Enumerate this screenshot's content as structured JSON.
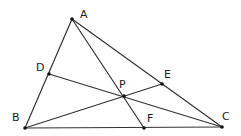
{
  "diagram": {
    "type": "triangle-cevians",
    "points": {
      "A": {
        "x": 72,
        "y": 19,
        "label": "A",
        "lx": 80,
        "ly": 18
      },
      "B": {
        "x": 25,
        "y": 128,
        "label": "B",
        "lx": 12,
        "ly": 121
      },
      "C": {
        "x": 222,
        "y": 127,
        "label": "C",
        "lx": 222,
        "ly": 120
      },
      "D": {
        "x": 49,
        "y": 74,
        "label": "D",
        "lx": 36,
        "ly": 71
      },
      "E": {
        "x": 162,
        "y": 84,
        "label": "E",
        "lx": 164,
        "ly": 78
      },
      "F": {
        "x": 144,
        "y": 128,
        "label": "F",
        "lx": 147,
        "ly": 122
      },
      "P": {
        "x": 124,
        "y": 96,
        "label": "P",
        "lx": 119,
        "ly": 88
      }
    },
    "segments": [
      [
        "A",
        "B"
      ],
      [
        "B",
        "C"
      ],
      [
        "C",
        "A"
      ],
      [
        "A",
        "F"
      ],
      [
        "B",
        "E"
      ],
      [
        "C",
        "D"
      ]
    ],
    "stroke_color": "#333333"
  }
}
